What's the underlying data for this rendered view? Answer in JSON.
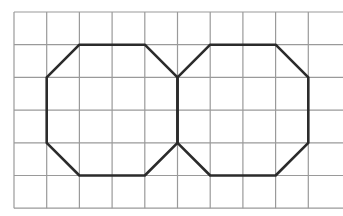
{
  "diagram": {
    "type": "grid-with-polygons",
    "background": "#ffffff",
    "grid": {
      "origin_x": 14,
      "origin_y": 12,
      "cell": 32.7,
      "columns": 10,
      "rows": 6,
      "line_color": "#9a9a9a",
      "line_width": 1.2,
      "right_edge_open": true
    },
    "shapes": [
      {
        "name": "left-octagon",
        "stroke": "#2b2b2b",
        "stroke_width": 2.6,
        "points": [
          [
            1,
            2
          ],
          [
            2,
            1
          ],
          [
            4,
            1
          ],
          [
            5,
            2
          ],
          [
            5,
            4
          ],
          [
            4,
            5
          ],
          [
            2,
            5
          ],
          [
            1,
            4
          ]
        ]
      },
      {
        "name": "right-octagon",
        "stroke": "#2b2b2b",
        "stroke_width": 2.6,
        "points": [
          [
            5,
            2
          ],
          [
            6,
            1
          ],
          [
            8,
            1
          ],
          [
            9,
            2
          ],
          [
            9,
            4
          ],
          [
            8,
            5
          ],
          [
            6,
            5
          ],
          [
            5,
            4
          ]
        ]
      }
    ]
  }
}
